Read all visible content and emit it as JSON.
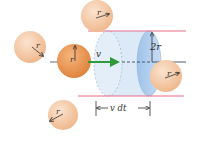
{
  "labels": {
    "radius": "r",
    "velocity": "v",
    "diameter": "2r",
    "distance": "v dt"
  },
  "colors": {
    "sphere_light": "#f6c9a4",
    "sphere_dark": "#ee9a55",
    "cylinder_fill": "#d9e9f7",
    "cylinder_front": "#a9c9ec",
    "cylinder_edge": "#8fb3dc",
    "boundary_line": "#e86a86",
    "velocity_arrow": "#2e9a3c",
    "axis_line": "#3a4a5a"
  }
}
